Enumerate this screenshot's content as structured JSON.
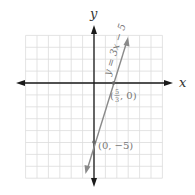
{
  "chart_data": {
    "type": "line",
    "title": "",
    "xlabel": "x",
    "ylabel": "y",
    "xlim": [
      -6,
      6
    ],
    "ylim": [
      -8,
      4
    ],
    "grid": true,
    "series": [
      {
        "name": "y = 3x - 5",
        "equation": "y = 3x − 5",
        "slope": 3,
        "intercept": -5,
        "x": [
          -0.8,
          2.9
        ],
        "y": [
          -7.4,
          3.7
        ]
      }
    ],
    "annotations": [
      {
        "point": [
          0,
          -5
        ],
        "label": "(0, −5)"
      },
      {
        "point": [
          1.6667,
          0
        ],
        "label_open": "(",
        "frac_num": "5",
        "frac_den": "3",
        "label_close": ", 0)"
      }
    ]
  },
  "labels": {
    "x_axis": "x",
    "y_axis": "y",
    "equation": "y = 3x − 5",
    "point_intercept_y": "(0, −5)",
    "point_intercept_x_open": "(",
    "point_intercept_x_num": "5",
    "point_intercept_x_den": "3",
    "point_intercept_x_close": ", 0)"
  },
  "colors": {
    "grid": "#dcdcdc",
    "axis": "#1a1a1a",
    "line": "#8a8a8a",
    "point": "#666666",
    "label": "#777777"
  }
}
